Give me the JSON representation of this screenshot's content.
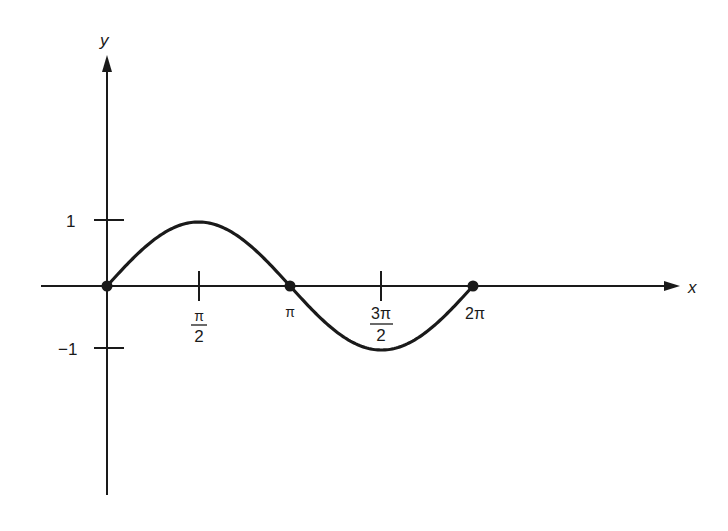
{
  "chart_data": {
    "type": "line",
    "title": "",
    "function": "y = sin(x)",
    "xlabel": "x",
    "ylabel": "y",
    "x_ticks": [
      "π/2",
      "π",
      "3π/2",
      "2π"
    ],
    "x_tick_values": [
      1.5708,
      3.1416,
      4.7124,
      6.2832
    ],
    "y_ticks": [
      "1",
      "−1"
    ],
    "y_tick_values": [
      1,
      -1
    ],
    "xlim": [
      -0.73,
      6.2832
    ],
    "ylim": [
      -3.2,
      3.6
    ],
    "grid": false,
    "legend": null,
    "series": [
      {
        "name": "sin(x)",
        "x": [
          0,
          0.7854,
          1.5708,
          2.3562,
          3.1416,
          3.927,
          4.7124,
          5.4978,
          6.2832
        ],
        "values": [
          0,
          0.7071,
          1,
          0.7071,
          0,
          -0.7071,
          -1,
          -0.7071,
          0
        ]
      }
    ],
    "marked_points": [
      {
        "x": 0,
        "y": 0,
        "label": "0"
      },
      {
        "x": 3.1416,
        "y": 0,
        "label": "π"
      },
      {
        "x": 6.2832,
        "y": 0,
        "label": "2π"
      }
    ]
  },
  "labels": {
    "x_axis": "x",
    "y_axis": "y",
    "y_tick_pos": "1",
    "y_tick_neg": "−1",
    "x_tick_pi_over_2_num": "π",
    "x_tick_pi_over_2_den": "2",
    "x_tick_pi": "π",
    "x_tick_3pi_over_2_num": "3π",
    "x_tick_3pi_over_2_den": "2",
    "x_tick_2pi": "2π"
  },
  "colors": {
    "ink": "#1a1a1a",
    "background": "#ffffff"
  }
}
